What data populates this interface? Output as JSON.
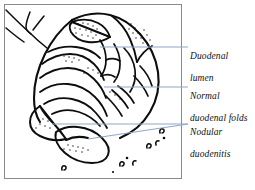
{
  "figure": {
    "type": "medical-line-illustration",
    "frame": {
      "border_color": "#8a8a8a"
    },
    "ink_color": "#0d0d0d",
    "leader_color": "#8fa8c8",
    "background": "#ffffff"
  },
  "labels": [
    {
      "id": "duodenal-lumen",
      "text": "Duodenal\nlumen",
      "line1": "Duodenal",
      "line2": "lumen"
    },
    {
      "id": "normal-duodenal-folds",
      "text": "Normal\nduodenal folds",
      "line1": "Normal",
      "line2": "duodenal folds"
    },
    {
      "id": "nodular-duodenitis",
      "text": "Nodular\nduodenitis",
      "line1": "Nodular",
      "line2": "duodenitis"
    }
  ]
}
